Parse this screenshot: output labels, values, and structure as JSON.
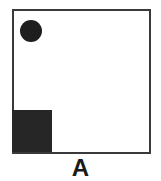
{
  "figure": {
    "label": "A",
    "elements": [
      {
        "shape": "square-frame",
        "color": "#3a3a3a"
      },
      {
        "shape": "circle",
        "position": "top-left",
        "color": "#1e1e1e"
      },
      {
        "shape": "filled-square",
        "position": "bottom-left",
        "color": "#262626"
      }
    ]
  }
}
